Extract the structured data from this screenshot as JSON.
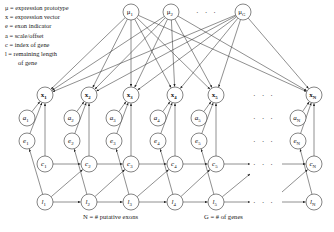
{
  "legend": [
    {
      "symbol": "μ",
      "text": "μ  = expression prototype"
    },
    {
      "symbol": "x",
      "text": "x = expression vector"
    },
    {
      "symbol": "e",
      "text": "e = exon indicator"
    },
    {
      "symbol": "a",
      "text": "a = scale/offset"
    },
    {
      "symbol": "c",
      "text": "c = index of gene"
    },
    {
      "symbol": "l",
      "text": "l = remaining length"
    },
    {
      "symbol": "",
      "text": "of gene"
    }
  ],
  "captions": {
    "n_label": "N = # putative exons",
    "g_label": "G = # of genes"
  },
  "ellipsis": "· · ·",
  "colors": {
    "stroke": "#333333",
    "text": "#111111",
    "background": "#ffffff"
  },
  "prototypes": [
    {
      "id": "mu1",
      "base": "μ",
      "sub": "1",
      "x": 131,
      "y": 12
    },
    {
      "id": "mu2",
      "base": "μ",
      "sub": "2",
      "x": 171,
      "y": 12
    },
    {
      "id": "muG",
      "base": "μ",
      "sub": "G",
      "x": 243,
      "y": 12
    }
  ],
  "prototype_ellipsis": {
    "x": 207,
    "y": 15
  },
  "columns": [
    {
      "idx": "1",
      "x": 45,
      "a_x": 27
    },
    {
      "idx": "2",
      "x": 89,
      "a_x": 72
    },
    {
      "idx": "3",
      "x": 131,
      "a_x": 114
    },
    {
      "idx": "4",
      "x": 175,
      "a_x": 158
    },
    {
      "idx": "5",
      "x": 216,
      "a_x": 199
    },
    {
      "idx": "N",
      "x": 314,
      "a_x": 298
    }
  ],
  "rows": {
    "x": {
      "y": 95,
      "label": "x",
      "bold": true
    },
    "a": {
      "y": 118,
      "label": "a",
      "italic": true
    },
    "e": {
      "y": 141,
      "label": "e",
      "italic": true
    },
    "c": {
      "y": 164,
      "label": "c",
      "italic": true
    },
    "l": {
      "y": 202,
      "label": "l",
      "italic": true
    }
  },
  "row_ellipses": [
    {
      "x": 264,
      "y": 98
    },
    {
      "x": 264,
      "y": 121
    },
    {
      "x": 264,
      "y": 144
    },
    {
      "x": 264,
      "y": 167
    },
    {
      "x": 264,
      "y": 205
    }
  ],
  "node_radius": 8
}
